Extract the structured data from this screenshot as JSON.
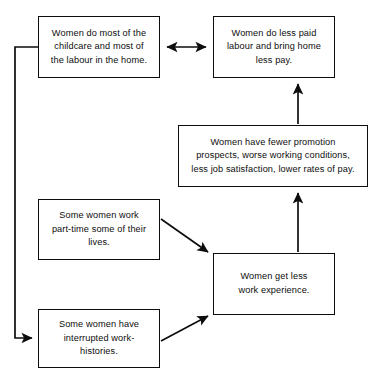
{
  "diagram": {
    "type": "flowchart",
    "background_color": "#ffffff",
    "line_color": "#0d0d0d",
    "nodes": [
      {
        "id": "childcare",
        "label": "Women do most of the\nchildcare and most of\nthe labour in the home.",
        "x": 38,
        "y": 16,
        "width": 122,
        "height": 62
      },
      {
        "id": "less-paid",
        "label": "Women do less paid\nlabour and bring home\nless pay.",
        "x": 213,
        "y": 16,
        "width": 122,
        "height": 62
      },
      {
        "id": "promotion",
        "label": "Women have fewer promotion\nprospects, worse working conditions,\nless job satisfaction, lower rates of pay.",
        "x": 178,
        "y": 125,
        "width": 190,
        "height": 62
      },
      {
        "id": "part-time",
        "label": "Some women work\npart-time some of their\nlives.",
        "x": 38,
        "y": 199,
        "width": 122,
        "height": 61
      },
      {
        "id": "experience",
        "label": "Women get less\nwork experience.",
        "x": 213,
        "y": 253,
        "width": 122,
        "height": 62
      },
      {
        "id": "interrupted",
        "label": "Some women have\ninterrupted work-\nhistories.",
        "x": 38,
        "y": 309,
        "width": 122,
        "height": 59
      }
    ],
    "connectors": [
      {
        "id": "childcare-lesspaid",
        "from": "childcare",
        "to": "less-paid",
        "style": "double-headed-horizontal"
      },
      {
        "id": "promotion-lesspaid",
        "from": "promotion",
        "to": "less-paid",
        "style": "single-headed-vertical-up"
      },
      {
        "id": "experience-promotion",
        "from": "experience",
        "to": "promotion",
        "style": "single-headed-vertical-up"
      },
      {
        "id": "parttime-experience",
        "from": "part-time",
        "to": "experience",
        "style": "single-headed-diagonal-down-right"
      },
      {
        "id": "interrupted-experience",
        "from": "interrupted",
        "to": "experience",
        "style": "single-headed-diagonal-up-right"
      },
      {
        "id": "childcare-interrupted",
        "from": "childcare",
        "to": "interrupted",
        "style": "feedback-loop-left"
      }
    ]
  }
}
